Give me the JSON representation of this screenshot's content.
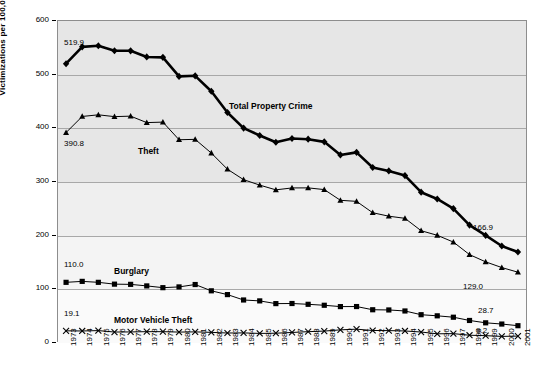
{
  "chart_data": {
    "type": "line",
    "title": "",
    "xlabel": "",
    "ylabel": "Victimizations per 100,000 Households",
    "ylim": [
      0,
      600
    ],
    "yticks": [
      0,
      100,
      200,
      300,
      400,
      500,
      600
    ],
    "grid": true,
    "legend_position": "inline-labels",
    "categories": [
      "1973",
      "1974",
      "1975",
      "1976",
      "1977",
      "1978",
      "1979",
      "1980",
      "1981",
      "1982",
      "1983",
      "1984",
      "1985",
      "1986",
      "1987",
      "1988",
      "1989",
      "1990",
      "1991",
      "1992",
      "1993",
      "1994",
      "1995",
      "1996",
      "1997",
      "1998",
      "1999",
      "2000",
      "2001"
    ],
    "series": [
      {
        "name": "Total Property Crime",
        "marker": "diamond",
        "color": "#000000",
        "linewidth": 2.6,
        "start_label": "519.9",
        "end_label": "166.9",
        "values": [
          519.9,
          551.5,
          553.6,
          544.2,
          544.1,
          532.6,
          531.8,
          496.1,
          497.2,
          468.3,
          428.4,
          399.2,
          385.4,
          372.7,
          379.6,
          378.4,
          373.4,
          348.9,
          353.7,
          325.3,
          318.9,
          310.2,
          279.0,
          266.3,
          248.3,
          217.4,
          198.0,
          178.1,
          166.9
        ]
      },
      {
        "name": "Theft",
        "marker": "triangle",
        "color": "#000000",
        "linewidth": 1.0,
        "start_label": "390.8",
        "end_label": "129.0",
        "values": [
          390.8,
          421.0,
          424.1,
          420.7,
          421.6,
          409.5,
          410.4,
          377.4,
          378.1,
          352.4,
          322.1,
          302.5,
          292.3,
          283.4,
          287.0,
          287.1,
          283.9,
          263.8,
          261.8,
          240.5,
          234.0,
          230.0,
          206.8,
          198.2,
          185.5,
          162.0,
          148.4,
          137.7,
          129.0
        ]
      },
      {
        "name": "Burglary",
        "marker": "square",
        "color": "#000000",
        "linewidth": 1.0,
        "start_label": "110.0",
        "end_label": "28.7",
        "values": [
          110.0,
          111.8,
          110.0,
          106.6,
          106.2,
          103.3,
          100.0,
          101.4,
          105.9,
          94.1,
          87.0,
          76.9,
          75.2,
          70.1,
          70.3,
          68.8,
          67.0,
          64.5,
          64.6,
          58.6,
          58.2,
          56.3,
          49.3,
          47.2,
          44.6,
          38.5,
          34.1,
          31.8,
          28.7
        ]
      },
      {
        "name": "Motor Vehicle Theft",
        "marker": "x",
        "color": "#000000",
        "linewidth": 1.0,
        "start_label": "19.1",
        "end_label": "9.2",
        "values": [
          19.1,
          18.8,
          19.5,
          16.8,
          17.0,
          17.5,
          17.5,
          16.7,
          17.1,
          16.2,
          15.0,
          15.2,
          14.2,
          14.6,
          16.0,
          17.5,
          18.6,
          20.9,
          22.2,
          19.7,
          19.5,
          18.8,
          16.8,
          13.5,
          13.8,
          10.8,
          10.0,
          8.6,
          9.2
        ]
      }
    ]
  },
  "annotations": {
    "total_property_crime_label": "Total Property Crime",
    "theft_label": "Theft",
    "burglary_label": "Burglary",
    "motor_vehicle_theft_label": "Motor Vehicle Theft"
  }
}
